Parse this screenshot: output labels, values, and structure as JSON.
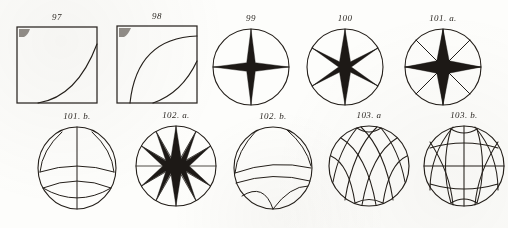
{
  "plate": {
    "title": "Engraved figure plate",
    "background_color": "#fdfdfb",
    "ink_color": "#241f1a",
    "width": 508,
    "height": 228,
    "rows": 2,
    "columns": 5
  },
  "figures": [
    {
      "id": "fig-97",
      "caption": "97",
      "kind": "square-plot",
      "row": 1,
      "column": 1,
      "x": 16,
      "y": 26,
      "width": 82,
      "height": 78,
      "description": "Square frame with a single concave-up curve rising from the bottom edge to the upper right corner",
      "curves": [
        {
          "name": "rising-concave-up-curve",
          "start": [
            0.26,
            1.0
          ],
          "control": [
            0.74,
            0.93
          ],
          "end": [
            1.0,
            0.24
          ]
        }
      ],
      "corner_smudge": true
    },
    {
      "id": "fig-98",
      "caption": "98",
      "kind": "square-plot",
      "row": 1,
      "column": 2,
      "x": 116,
      "y": 25,
      "width": 82,
      "height": 79,
      "description": "Square frame with an upper concave-down saturating curve and a lower concave-up curve",
      "curves": [
        {
          "name": "saturating-concave-down-curve",
          "start": [
            0.17,
            1.0
          ],
          "control": [
            0.26,
            0.16
          ],
          "end": [
            1.0,
            0.14
          ]
        },
        {
          "name": "rising-concave-up-curve",
          "start": [
            0.45,
            1.0
          ],
          "control": [
            0.8,
            0.86
          ],
          "end": [
            1.0,
            0.46
          ]
        }
      ],
      "corner_smudge": true
    },
    {
      "id": "fig-99",
      "caption": "99",
      "kind": "star-circle",
      "row": 1,
      "column": 3,
      "x": 211,
      "y": 27,
      "width": 80,
      "height": 80,
      "description": "Circle with an inscribed four-pointed star and two full diameters",
      "points": 4,
      "spoke_angles_deg": [
        0,
        90
      ],
      "star_rotation_deg": 0,
      "inner_radius_ratio": 0.11,
      "spokes_full_diameter": true
    },
    {
      "id": "fig-100",
      "caption": "100",
      "kind": "star-circle",
      "row": 1,
      "column": 4,
      "x": 305,
      "y": 27,
      "width": 80,
      "height": 80,
      "description": "Circle with an inscribed six-pointed star and three full diameters",
      "points": 6,
      "spoke_angles_deg": [
        0,
        60,
        120
      ],
      "star_rotation_deg": 90,
      "inner_radius_ratio": 0.16,
      "spokes_full_diameter": true
    },
    {
      "id": "fig-101a",
      "caption": "101. a.",
      "kind": "star-circle",
      "row": 1,
      "column": 5,
      "x": 403,
      "y": 27,
      "width": 80,
      "height": 80,
      "description": "Circle with an inscribed eight-pointed star and four full diameters",
      "points": 8,
      "spoke_angles_deg": [
        0,
        45,
        90,
        135
      ],
      "star_rotation_deg": 90,
      "inner_radius_ratio": 0.18,
      "spokes_full_diameter": true
    },
    {
      "id": "fig-101b",
      "caption": "101. b.",
      "caption_top": true,
      "kind": "arc-lens-circle",
      "row": 2,
      "column": 1,
      "x": 36,
      "y": 133,
      "width": 82,
      "height": 82,
      "description": "Circle with a vertical diameter, two hook-shaped upper arcs and two shallow lower arcs",
      "meridians": 1,
      "parallels": 2,
      "variant": "sparse"
    },
    {
      "id": "fig-102a",
      "caption": "102. a.",
      "caption_top": true,
      "kind": "star-circle",
      "row": 2,
      "column": 2,
      "x": 134,
      "y": 131,
      "width": 84,
      "height": 84,
      "description": "Circle with an inscribed twelve-pointed star and six full diameters",
      "points": 12,
      "spoke_angles_deg": [
        0,
        30,
        60,
        90,
        120,
        150
      ],
      "star_rotation_deg": 90,
      "inner_radius_ratio": 0.25,
      "spokes_full_diameter": true
    },
    {
      "id": "fig-102b",
      "caption": "102. b.",
      "caption_top": true,
      "kind": "arc-lens-circle",
      "row": 2,
      "column": 3,
      "x": 232,
      "y": 133,
      "width": 82,
      "height": 82,
      "description": "Circle with hook-shaped upper arcs and lower arcs, right half only",
      "meridians": 1,
      "parallels": 2,
      "variant": "sparse-right"
    },
    {
      "id": "fig-103a",
      "caption": "103. a",
      "caption_top": true,
      "kind": "net-circle",
      "row": 2,
      "column": 4,
      "x": 327,
      "y": 130,
      "width": 84,
      "height": 84,
      "description": "Circle filled with a crossing net of oblique arcs forming curvilinear quadrilaterals",
      "family_a_count": 4,
      "family_b_count": 4,
      "variant": "oblique"
    },
    {
      "id": "fig-103b",
      "caption": "103. b.",
      "caption_top": true,
      "kind": "net-circle",
      "row": 2,
      "column": 5,
      "x": 422,
      "y": 130,
      "width": 84,
      "height": 84,
      "description": "Circle with a grid of vertical meridian arcs, horizontal parallel arcs and oblique crossing arcs",
      "family_a_count": 3,
      "family_b_count": 3,
      "variant": "meridian-parallel"
    }
  ]
}
